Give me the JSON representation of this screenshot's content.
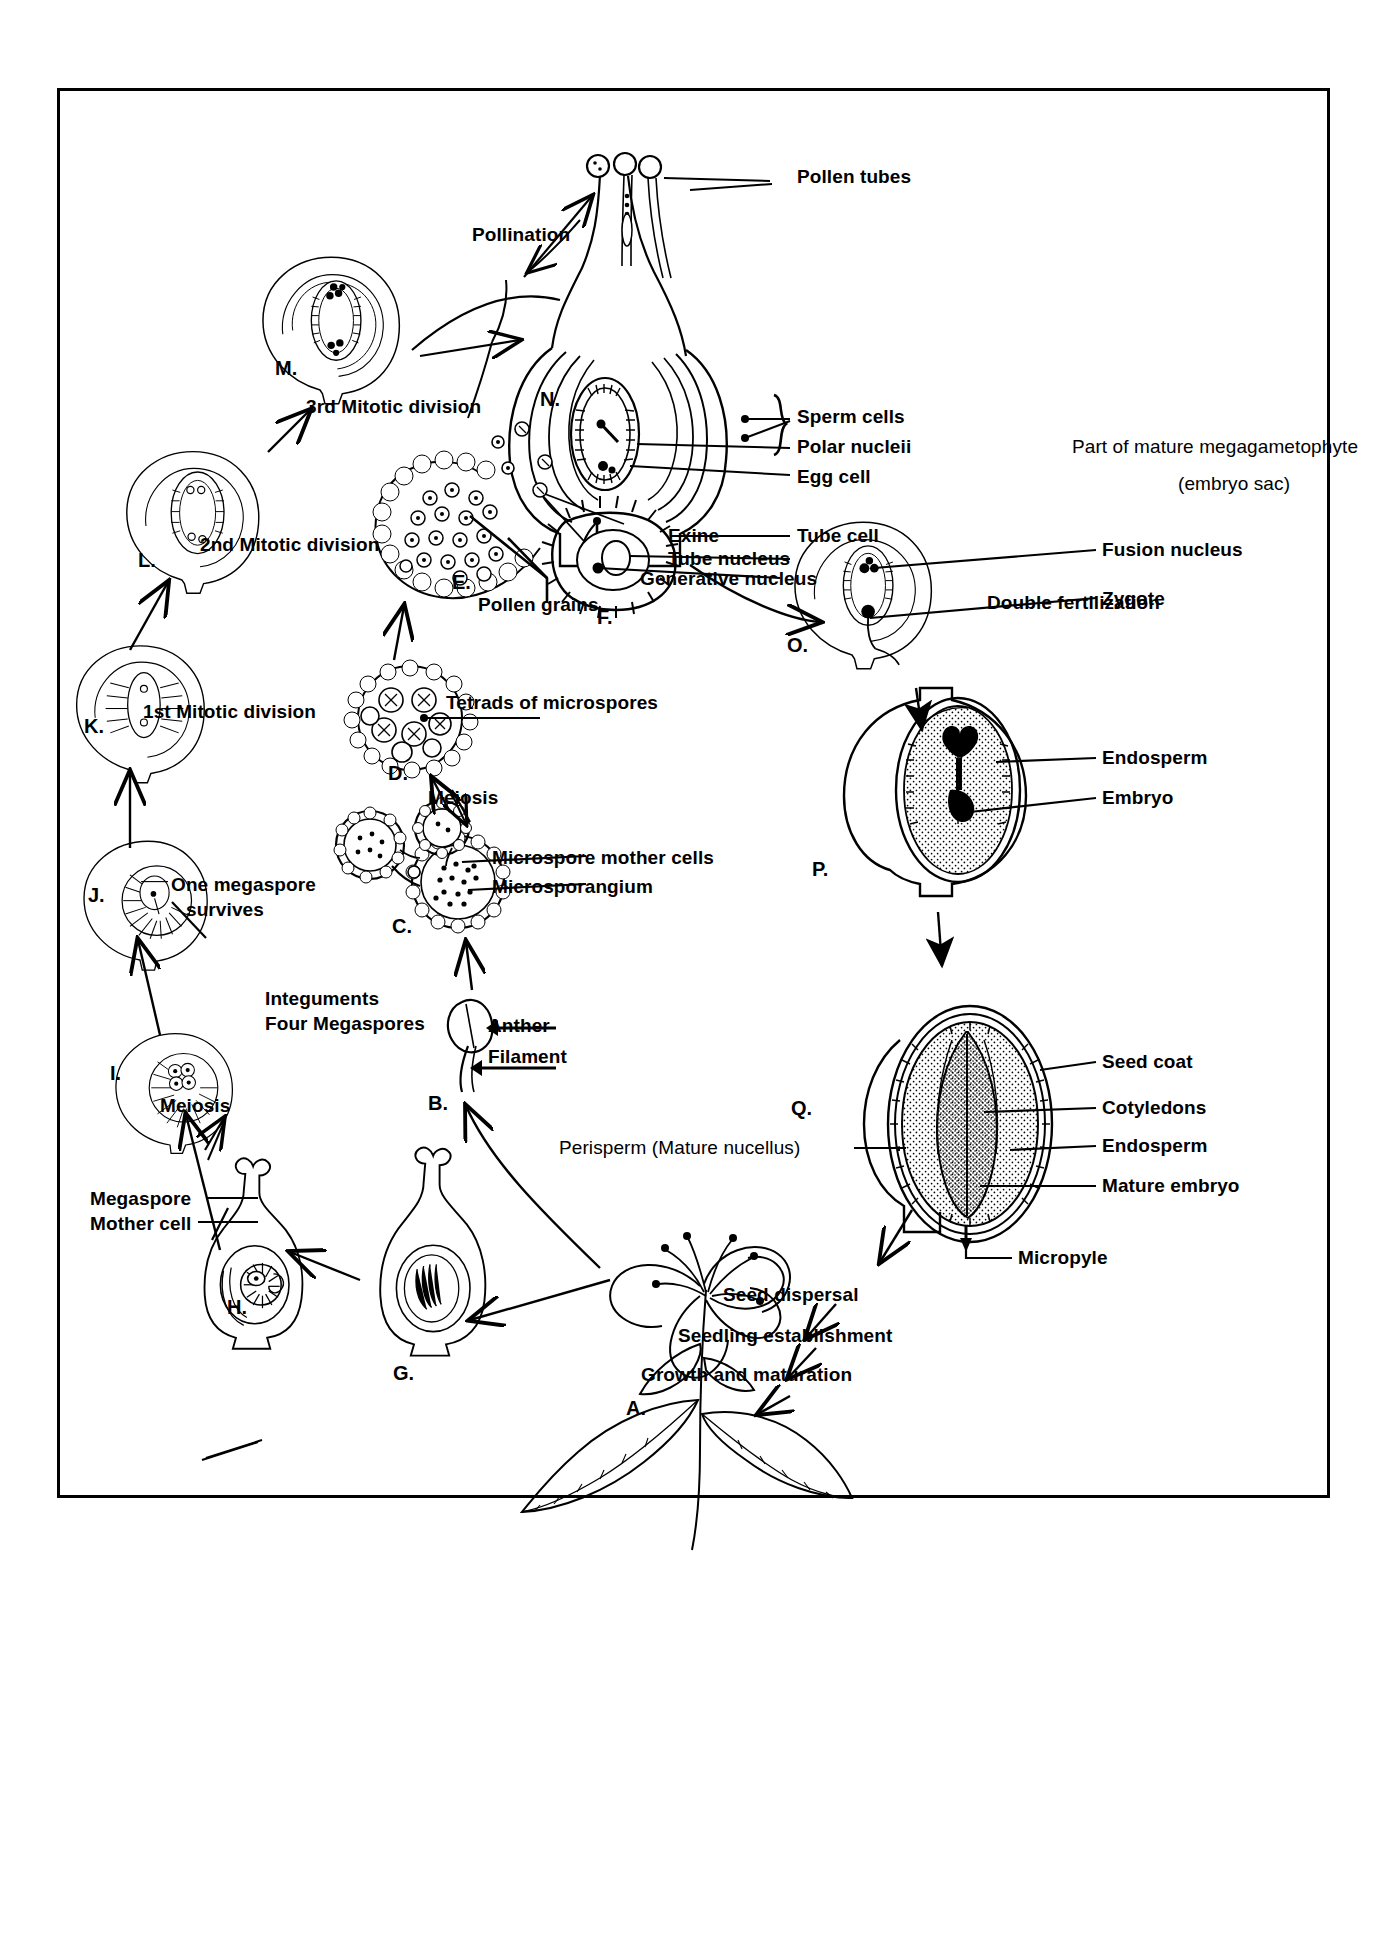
{
  "diagram": {
    "border_color": "#000000",
    "background": "#ffffff"
  },
  "stages": [
    {
      "id": "A",
      "label": "A.",
      "x": 626,
      "y": 1397,
      "caption": "Flowering plant"
    },
    {
      "id": "B",
      "label": "B.",
      "x": 428,
      "y": 1092,
      "caption": "Stamen"
    },
    {
      "id": "C",
      "label": "C.",
      "x": 392,
      "y": 915,
      "caption": "Microsporangium cross-section"
    },
    {
      "id": "D",
      "label": "D.",
      "x": 388,
      "y": 762,
      "caption": "Tetrads of microspores"
    },
    {
      "id": "E",
      "label": "E.",
      "x": 452,
      "y": 571,
      "caption": "Pollen grains released"
    },
    {
      "id": "F",
      "label": "F.",
      "x": 597,
      "y": 606,
      "caption": "Mature pollen grain"
    },
    {
      "id": "G",
      "label": "G.",
      "x": 393,
      "y": 1362,
      "caption": "Ovule"
    },
    {
      "id": "H",
      "label": "H.",
      "x": 227,
      "y": 1296,
      "caption": "Megaspore mother cell"
    },
    {
      "id": "I",
      "label": "I.",
      "x": 110,
      "y": 1062,
      "caption": "Four megaspores"
    },
    {
      "id": "J",
      "label": "J.",
      "x": 88,
      "y": 884,
      "caption": "One megaspore survives"
    },
    {
      "id": "K",
      "label": "K.",
      "x": 84,
      "y": 715,
      "caption": "Before 1st mitotic division"
    },
    {
      "id": "L",
      "label": "L.",
      "x": 138,
      "y": 549,
      "caption": "After 1st mitotic division"
    },
    {
      "id": "M",
      "label": "M.",
      "x": 275,
      "y": 357,
      "caption": "After 2nd mitotic division"
    },
    {
      "id": "N",
      "label": "N.",
      "x": 540,
      "y": 388,
      "caption": "Mature embryo sac / pollination"
    },
    {
      "id": "O",
      "label": "O.",
      "x": 787,
      "y": 634,
      "caption": "Zygote and fusion nucleus"
    },
    {
      "id": "P",
      "label": "P.",
      "x": 812,
      "y": 858,
      "caption": "Developing embryo"
    },
    {
      "id": "Q",
      "label": "Q.",
      "x": 791,
      "y": 1097,
      "caption": "Mature seed"
    }
  ],
  "labels": {
    "pollen_tubes": "Pollen tubes",
    "pollination": "Pollination",
    "sperm_cells": "Sperm cells",
    "polar_nucleii": "Polar nucleii",
    "egg_cell": "Egg cell",
    "tube_cell": "Tube cell",
    "part_of_mature_megagametophyte": "Part of mature megagametophyte",
    "embryo_sac": "(embryo sac)",
    "double_fertilization": "Double fertilization",
    "fusion_nucleus": "Fusion nucleus",
    "zygote": "Zygote",
    "endosperm_p": "Endosperm",
    "embryo_p": "Embryo",
    "seed_coat": "Seed coat",
    "cotyledons": "Cotyledons",
    "endosperm_q": "Endosperm",
    "mature_embryo": "Mature embryo",
    "perisperm": "Perisperm (Mature nucellus)",
    "micropyle": "Micropyle",
    "seed_dispersal": "Seed dispersal",
    "seedling_establishment": "Seedling establishment",
    "growth_and_maturation": "Growth and maturation",
    "third_mitotic_division": "3rd Mitotic division",
    "second_mitotic_division": "2nd Mitotic division",
    "first_mitotic_division": "1st Mitotic division",
    "one_megaspore": "One megaspore",
    "survives": "survives",
    "integuments": "Integuments",
    "four_megaspores": "Four Megaspores",
    "meiosis_left": "Meiosis",
    "megaspore": "Megaspore",
    "mother_cell": "Mother cell",
    "exine": "Exine",
    "tube_nucleus": "Tube nucleus",
    "generative_nucleus": "Generative nucleus",
    "pollen_grains": "Pollen grains",
    "tetrads_of_microspores": "Tetrads of microspores",
    "meiosis_center": "Meiosis",
    "microspore_mother_cells": "Microspore mother cells",
    "microsporangium": "Microsporangium",
    "anther": "Anther",
    "filament": "Filament"
  }
}
